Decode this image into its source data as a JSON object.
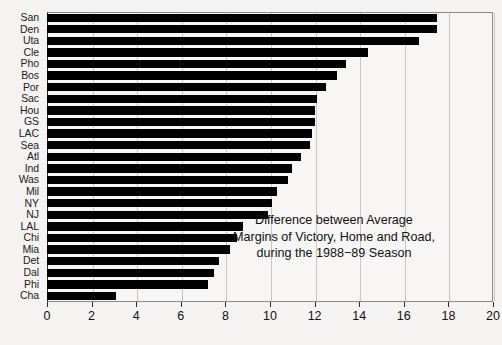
{
  "chart_data": {
    "type": "bar",
    "orientation": "horizontal",
    "title": "",
    "xlabel": "",
    "ylabel": "",
    "xlim": [
      0,
      20
    ],
    "ylim": null,
    "grid": true,
    "grid_axis": "x",
    "legend": null,
    "bar_color": "#000000",
    "background_color": "#f4f3f1",
    "xticks": [
      0,
      2,
      4,
      6,
      8,
      10,
      12,
      14,
      16,
      18,
      20
    ],
    "xticklabels": [
      "0",
      "2",
      "4",
      "6",
      "8",
      "10",
      "12",
      "14",
      "16",
      "18",
      "20"
    ],
    "categories": [
      "San",
      "Den",
      "Uta",
      "Cle",
      "Pho",
      "Bos",
      "Por",
      "Sac",
      "Hou",
      "GS",
      "LAC",
      "Sea",
      "Atl",
      "Ind",
      "Was",
      "Mil",
      "NY",
      "NJ",
      "LAL",
      "Chi",
      "Mia",
      "Det",
      "Dal",
      "Phi",
      "Cha"
    ],
    "values": [
      17.5,
      17.5,
      16.7,
      14.4,
      13.4,
      13.0,
      12.5,
      12.1,
      12.0,
      12.0,
      11.9,
      11.8,
      11.4,
      11.0,
      10.8,
      10.3,
      10.1,
      9.9,
      8.8,
      8.5,
      8.2,
      7.7,
      7.5,
      7.2,
      3.1
    ],
    "annotations": [
      "Difference between Average",
      "Margins of Victory, Home and Road,",
      "during the 1988−89 Season"
    ]
  }
}
